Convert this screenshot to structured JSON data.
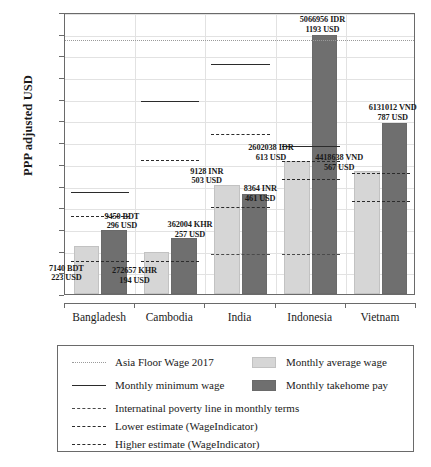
{
  "chart_data": {
    "type": "bar",
    "title": "",
    "xlabel": "",
    "ylabel": "PPP adjusted USD",
    "ylim": [
      0,
      1300
    ],
    "ytick_step": 100,
    "yticks": [
      "1300",
      "1200",
      "1100",
      "1000",
      "900",
      "800",
      "700",
      "600",
      "500",
      "400",
      "300",
      "200",
      "100",
      "0"
    ],
    "grid": true,
    "legend_position": "below-plot",
    "categories": [
      "Bangladesh",
      "Cambodia",
      "India",
      "Indonesia",
      "Vietnam"
    ],
    "series": [
      {
        "name": "Monthly average wage",
        "color": "#d6d6d6",
        "values": [
          223,
          194,
          503,
          613,
          567
        ]
      },
      {
        "name": "Monthly takehome pay",
        "color": "#6f6f6f",
        "values": [
          296,
          257,
          461,
          1193,
          787
        ]
      }
    ],
    "bar_labels": [
      {
        "country": "Bangladesh",
        "avg_local": "7140 BDT",
        "avg_usd": "223 USD",
        "take_local": "9450 BDT",
        "take_usd": "296 USD"
      },
      {
        "country": "Cambodia",
        "avg_local": "272657 KHR",
        "avg_usd": "194 USD",
        "take_local": "362004 KHR",
        "take_usd": "257 USD"
      },
      {
        "country": "India",
        "avg_local": "9128 INR",
        "avg_usd": "503 USD",
        "take_local": "8364 INR",
        "take_usd": "461 USD"
      },
      {
        "country": "Indonesia",
        "avg_local": "2602038 IDR",
        "avg_usd": "613 USD",
        "take_local": "5066956 IDR",
        "take_usd": "1193 USD"
      },
      {
        "country": "Vietnam",
        "avg_local": "4418638 VND",
        "avg_usd": "567 USD",
        "take_local": "6131012 VND",
        "take_usd": "787 USD"
      }
    ],
    "reference_lines": {
      "asia_floor_wage_2017": {
        "value": 1180,
        "style": "dotted",
        "span": "full"
      },
      "monthly_minimum_wage": {
        "style": "solid",
        "values": [
          480,
          900,
          1070,
          690,
          null
        ]
      },
      "international_poverty_line": {
        "style": "dash-dot",
        "values": [
          163,
          163,
          195,
          195,
          null
        ]
      },
      "lower_estimate_wageindicator": {
        "style": "dashed",
        "values": [
          163,
          163,
          412,
          540,
          440
        ]
      },
      "higher_estimate_wageindicator": {
        "style": "dashed",
        "values": [
          370,
          627,
          748,
          622,
          567
        ]
      }
    }
  },
  "legend": {
    "items": [
      {
        "key": "dotted-line",
        "label": "Asia Floor Wage 2017"
      },
      {
        "key": "solid-line",
        "label": "Monthly minimum wage"
      },
      {
        "key": "dashdot-line",
        "label": "Internatinal poverty line in monthly terms"
      },
      {
        "key": "dashed-line",
        "label": "Lower estimate (WageIndicator)"
      },
      {
        "key": "dashed-line",
        "label": "Higher estimate (WageIndicator)"
      },
      {
        "key": "light-swatch",
        "label": "Monthly average wage"
      },
      {
        "key": "dark-swatch",
        "label": "Monthly takehome pay"
      }
    ]
  }
}
